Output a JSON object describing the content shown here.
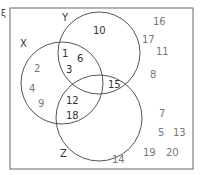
{
  "universal_symbol": "ξ",
  "sets": {
    "X": {
      "label": "X"
    },
    "Y": {
      "label": "Y"
    },
    "Z": {
      "label": "Z"
    }
  },
  "regions": {
    "X_only": [
      "2",
      "4",
      "9"
    ],
    "Y_only": [
      "10"
    ],
    "Z_only": [
      "14"
    ],
    "X_and_Y_only": [
      "1",
      "6",
      "3"
    ],
    "X_and_Z_only": [
      "12",
      "18"
    ],
    "Y_and_Z_only": [
      "15"
    ],
    "X_Y_Z": [],
    "outside": [
      "16",
      "17",
      "11",
      "8",
      "7",
      "5",
      "13",
      "19",
      "20"
    ]
  }
}
